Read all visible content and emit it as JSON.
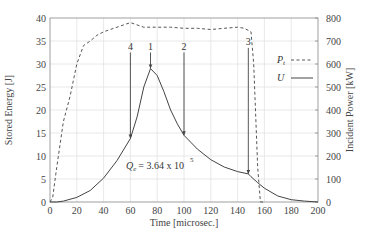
{
  "chart_data": {
    "type": "line",
    "title": "",
    "xlabel": "Time [microsec.]",
    "ylabel": "Stored Energy [J]",
    "ylabel_right": "Incident Power [kW]",
    "xlim": [
      0,
      200
    ],
    "ylim": [
      0,
      40
    ],
    "ylim_right": [
      0,
      800
    ],
    "grid": true,
    "x_ticks": [
      0,
      20,
      40,
      60,
      80,
      100,
      120,
      140,
      160,
      180,
      200
    ],
    "y_ticks": [
      0,
      5,
      10,
      15,
      20,
      25,
      30,
      35,
      40
    ],
    "y_ticks_right": [
      0,
      100,
      200,
      300,
      400,
      500,
      600,
      700,
      800
    ],
    "legend": {
      "position": "upper right",
      "entries": [
        {
          "label": "P",
          "subscript": "t",
          "style": "dashed"
        },
        {
          "label": "U",
          "subscript": "",
          "style": "solid"
        }
      ]
    },
    "series": [
      {
        "name": "U",
        "axis": "left",
        "unit": "J",
        "style": "solid",
        "x": [
          0,
          5,
          10,
          20,
          30,
          40,
          50,
          60,
          65,
          70,
          75,
          80,
          85,
          90,
          95,
          100,
          110,
          120,
          130,
          140,
          148,
          150,
          155,
          160,
          170,
          180,
          190,
          200
        ],
        "values": [
          0,
          0,
          0.2,
          1.0,
          2.5,
          5.2,
          9.0,
          13.8,
          18.5,
          25.0,
          29.0,
          27.5,
          24.0,
          20.0,
          17.0,
          14.5,
          11.5,
          9.2,
          7.6,
          6.6,
          6.1,
          5.5,
          4.2,
          3.0,
          1.3,
          0.5,
          0.2,
          0
        ]
      },
      {
        "name": "Pt",
        "axis": "right",
        "unit": "kW",
        "style": "dashed",
        "x": [
          0,
          2,
          5,
          10,
          15,
          20,
          25,
          30,
          35,
          40,
          50,
          60,
          70,
          80,
          90,
          100,
          110,
          120,
          130,
          140,
          145,
          150,
          152,
          155,
          157,
          160
        ],
        "values": [
          0,
          20,
          150,
          350,
          460,
          600,
          680,
          700,
          725,
          740,
          760,
          780,
          760,
          760,
          760,
          755,
          755,
          750,
          755,
          760,
          755,
          740,
          600,
          150,
          0,
          0
        ]
      }
    ],
    "markers": [
      {
        "label": "4",
        "x": 60,
        "y_top": 32.5,
        "y_bottom": 13.8
      },
      {
        "label": "1",
        "x": 75,
        "y_top": 32.5,
        "y_bottom": 29.0
      },
      {
        "label": "2",
        "x": 100,
        "y_top": 32.5,
        "y_bottom": 14.5
      },
      {
        "label": "3",
        "x": 148,
        "y_top": 33.5,
        "y_bottom": 6.1
      }
    ],
    "annotations": [
      {
        "text": "Q",
        "subscript": "e",
        "rest": "= 3.64 x 10",
        "superscript": "5",
        "x": 75,
        "y": 9.5
      }
    ]
  }
}
